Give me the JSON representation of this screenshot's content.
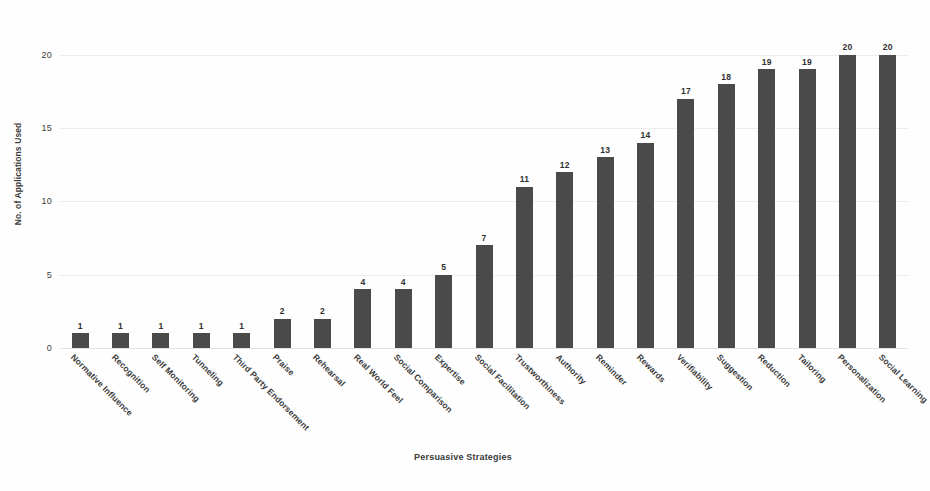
{
  "chart_data": {
    "type": "bar",
    "title": "",
    "xlabel": "Persuasive Strategies",
    "ylabel": "No. of Applications Used",
    "ylim": [
      0,
      21
    ],
    "yticks": [
      0,
      5,
      10,
      15,
      20
    ],
    "ytick_labels": [
      "0",
      "5",
      "10",
      "15",
      "20"
    ],
    "grid": true,
    "legend": "none",
    "bar_color": "#4a4a4a",
    "background_color": "#fefefe",
    "show_data_labels": true,
    "categories": [
      "Normative Influence",
      "Recognition",
      "Self Monitoring",
      "Tunneling",
      "Third Party Endorsement",
      "Praise",
      "Rehearsal",
      "Real World Feel",
      "Social Comparison",
      "Expertise",
      "Social Facilitation",
      "Trustworthiness",
      "Authority",
      "Reminder",
      "Rewards",
      "Verifiability",
      "Suggestion",
      "Reduction",
      "Tailoring",
      "Personalization",
      "Social Learning"
    ],
    "values": [
      1,
      1,
      1,
      1,
      1,
      2,
      2,
      4,
      4,
      5,
      7,
      11,
      12,
      13,
      14,
      17,
      18,
      19,
      19,
      20,
      20
    ],
    "data_labels": [
      "1",
      "1",
      "1",
      "1",
      "1",
      "2",
      "2",
      "4",
      "4",
      "5",
      "7",
      "11",
      "12",
      "13",
      "14",
      "17",
      "18",
      "19",
      "19",
      "20",
      "20"
    ]
  }
}
